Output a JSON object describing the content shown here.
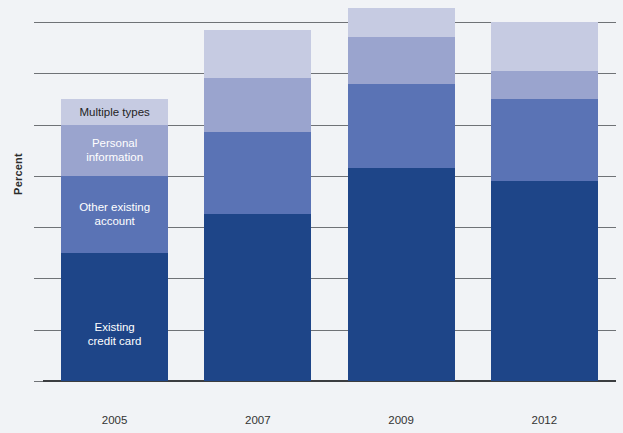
{
  "chart_data": {
    "type": "bar",
    "stacked": true,
    "title": "",
    "subtitle": "",
    "xlabel": "Year",
    "ylabel": "Percent",
    "categories": [
      "2005",
      "2007",
      "2009",
      "2012"
    ],
    "ylim": [
      0,
      7
    ],
    "yticks": [
      0,
      1,
      2,
      3,
      4,
      5,
      6,
      7
    ],
    "ytick_labels": [
      "0",
      "1",
      "2",
      "3",
      "4",
      "5",
      "6",
      "7"
    ],
    "grid": true,
    "legend_position": "inside-first-bar",
    "series": [
      {
        "name": "Existing credit card",
        "color": "#1e4588",
        "label_text_color": "#ffffff",
        "values": [
          2.5,
          3.25,
          4.15,
          3.9
        ]
      },
      {
        "name": "Other existing account",
        "color": "#5a73b5",
        "label_text_color": "#ffffff",
        "values": [
          1.5,
          1.6,
          1.65,
          1.6
        ]
      },
      {
        "name": "Personal information",
        "color": "#9aa4ce",
        "label_text_color": "#ffffff",
        "values": [
          1.0,
          1.05,
          0.9,
          0.55
        ]
      },
      {
        "name": "Multiple types",
        "color": "#c6cbe2",
        "label_text_color": "#242424",
        "values": [
          0.5,
          0.95,
          0.58,
          0.95
        ]
      }
    ],
    "totals": [
      5.5,
      6.85,
      7.28,
      7.0
    ],
    "legend_entries": [
      {
        "label": "Multiple types",
        "color": "#c6cbe2"
      },
      {
        "label": "Personal information",
        "color": "#9aa4ce"
      },
      {
        "label": "Other existing account",
        "color": "#5a73b5"
      },
      {
        "label": "Existing credit card",
        "color": "#1e4588"
      }
    ]
  },
  "axes": {
    "y_title": "Percent",
    "x_title": "Year",
    "y_tick_0": "0",
    "y_tick_1": "1",
    "y_tick_2": "2",
    "y_tick_3": "3",
    "y_tick_4": "4",
    "y_tick_5": "5",
    "y_tick_6": "6",
    "y_tick_7": "7",
    "x_tick_0": "2005",
    "x_tick_1": "2007",
    "x_tick_2": "2009",
    "x_tick_3": "2012"
  },
  "legend_labels": {
    "multiple_types": "Multiple types",
    "personal_information_line1": "Personal",
    "personal_information_line2": "information",
    "other_existing_line1": "Other existing",
    "other_existing_line2": "account",
    "existing_credit_card_line1": "Existing",
    "existing_credit_card_line2": "credit card"
  }
}
